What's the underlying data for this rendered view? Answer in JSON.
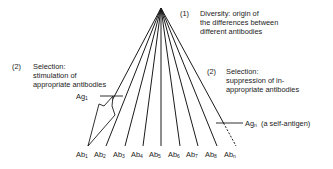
{
  "diagram": {
    "type": "clonal-selection-fan",
    "apex": {
      "x": 161,
      "y": 8
    },
    "line_color": "#1a1a1a",
    "stage1": {
      "number": "(1)",
      "lines": [
        "Diversity: origin of",
        "the differences between",
        "different antibodies"
      ]
    },
    "stage2_left": {
      "number": "(2)",
      "lines": [
        "Selection:",
        "stimulation of",
        "appropriate antibodies"
      ]
    },
    "stage2_right": {
      "number": "(2)",
      "lines": [
        "Selection:",
        "suppression of in-",
        "appropriate antibodies"
      ]
    },
    "antigen_1": {
      "base": "Ag",
      "sub": "1"
    },
    "antigen_n": {
      "base": "Ag",
      "sub": "n",
      "note": "(a self-antigen)"
    },
    "antibodies": [
      {
        "base": "Ab",
        "sub": "1",
        "x": 88
      },
      {
        "base": "Ab",
        "sub": "2",
        "x": 106
      },
      {
        "base": "Ab",
        "sub": "3",
        "x": 125
      },
      {
        "base": "Ab",
        "sub": "4",
        "x": 143
      },
      {
        "base": "Ab",
        "sub": "5",
        "x": 161
      },
      {
        "base": "Ab",
        "sub": "6",
        "x": 180
      },
      {
        "base": "Ab",
        "sub": "7",
        "x": 198
      },
      {
        "base": "Ab",
        "sub": "8",
        "x": 217
      },
      {
        "base": "Ab",
        "sub": "n",
        "x": 236
      }
    ]
  }
}
